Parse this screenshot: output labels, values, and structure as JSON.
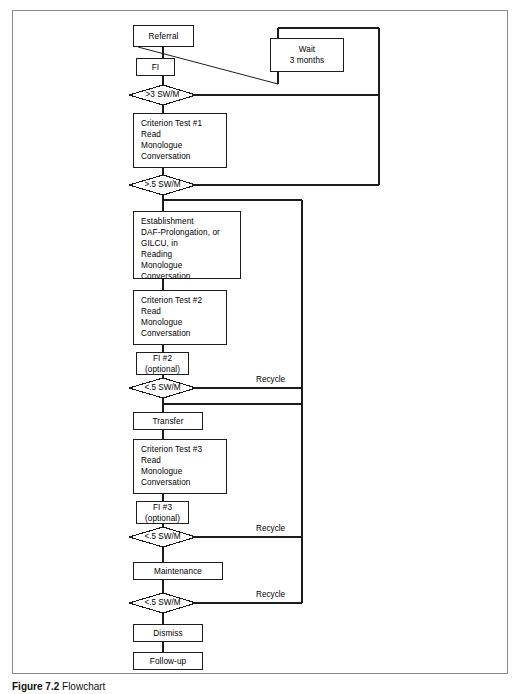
{
  "figure": {
    "caption_label": "Figure 7.2",
    "caption_text": "Flowchart"
  },
  "flowchart": {
    "type": "flowchart",
    "title": "Stuttering treatment program flowchart",
    "nodes": [
      {
        "id": "referral",
        "shape": "box",
        "label": "Referral"
      },
      {
        "id": "fi1",
        "shape": "box",
        "label": "FI"
      },
      {
        "id": "wait",
        "shape": "box",
        "label": "Wait\n3 months"
      },
      {
        "id": "d1",
        "shape": "diamond",
        "label": ">3 SW/M"
      },
      {
        "id": "ct1",
        "shape": "box",
        "label": "Criterion Test #1\n  Read\n  Monologue\n  Conversation"
      },
      {
        "id": "d2",
        "shape": "diamond",
        "label": ">.5 SW/M"
      },
      {
        "id": "estab",
        "shape": "box",
        "label": "Establishment\n  DAF-Prolongation, or\n  GILCU, in\n  Reading\n  Monologue\n  Conversation"
      },
      {
        "id": "ct2",
        "shape": "box",
        "label": "Criterion Test #2\n  Read\n  Monologue\n  Conversation"
      },
      {
        "id": "fi2",
        "shape": "box",
        "label": "FI #2\n(optional)"
      },
      {
        "id": "d3",
        "shape": "diamond",
        "label": "<.5 SW/M"
      },
      {
        "id": "transfer",
        "shape": "box",
        "label": "Transfer"
      },
      {
        "id": "ct3",
        "shape": "box",
        "label": "Criterion Test #3\n  Read\n  Monologue\n  Conversation"
      },
      {
        "id": "fi3",
        "shape": "box",
        "label": "FI #3\n(optional)"
      },
      {
        "id": "d4",
        "shape": "diamond",
        "label": "<.5 SW/M"
      },
      {
        "id": "maint",
        "shape": "box",
        "label": "Maintenance"
      },
      {
        "id": "d5",
        "shape": "diamond",
        "label": "<.5 SW/M"
      },
      {
        "id": "dismiss",
        "shape": "box",
        "label": "Dismiss"
      },
      {
        "id": "followup",
        "shape": "box",
        "label": "Follow-up"
      }
    ],
    "edge_labels": [
      {
        "id": "recycle1",
        "label": "Recycle"
      },
      {
        "id": "recycle2",
        "label": "Recycle"
      },
      {
        "id": "recycle3",
        "label": "Recycle"
      }
    ],
    "colors": {
      "line": "#1c1c1c",
      "frame": "#8a8a8a",
      "background": "#ffffff",
      "text": "#000000"
    }
  }
}
